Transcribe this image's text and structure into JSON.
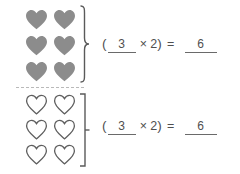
{
  "worksheet": {
    "background_color": "#ffffff",
    "filled_heart_color": "#8c8c8c",
    "outline_heart_color": "#5e5e5e",
    "ink_color": "#4f4f4f",
    "divider_label": "dashed-separator"
  },
  "groups": [
    {
      "id": "filled",
      "icon_name": "filled-heart-icon",
      "icon_style": "filled",
      "rows": 3,
      "columns": 2,
      "total_items": 6,
      "brace_name": "curly-brace",
      "equation": {
        "open_paren": "(",
        "factor_blank_value": "3",
        "times_symbol": "×",
        "multiplier": "2",
        "close_paren": ")",
        "equals_symbol": "=",
        "result_blank_value": "6"
      }
    },
    {
      "id": "outline",
      "icon_name": "outline-heart-icon",
      "icon_style": "outline",
      "rows": 3,
      "columns": 2,
      "total_items": 6,
      "brace_name": "square-bracket",
      "equation": {
        "open_paren": "(",
        "factor_blank_value": "3",
        "times_symbol": "×",
        "multiplier": "2",
        "close_paren": ")",
        "equals_symbol": "=",
        "result_blank_value": "6"
      }
    }
  ]
}
